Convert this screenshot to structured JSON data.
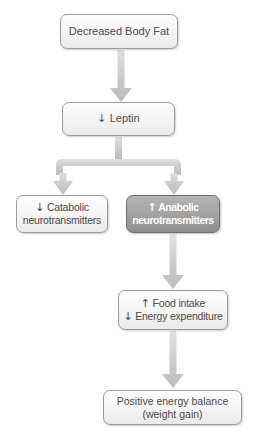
{
  "diagram": {
    "background_color": "#ffffff",
    "arrow_color": "#c9c9c9",
    "box_border_color": "#9b9b9b",
    "box_text_color": "#4a4a4a",
    "highlight_fill_color": "#a5a5a5",
    "highlight_text_color": "#ffffff"
  },
  "nodes": {
    "decreased_body_fat": {
      "label": "Decreased Body Fat"
    },
    "leptin": {
      "arrow": "↓",
      "label": "Leptin"
    },
    "catabolic": {
      "arrow": "↓",
      "line1": "Catabolic",
      "line2": "neurotransmitters"
    },
    "anabolic": {
      "arrow": "↑",
      "line1": "Anabolic",
      "line2": "neurotransmitters"
    },
    "food_intake": {
      "arrow_up": "↑",
      "line1": "Food intake",
      "arrow_down": "↓",
      "line2": "Energy expenditure"
    },
    "positive_energy": {
      "line1": "Positive energy balance",
      "line2": "(weight gain)"
    }
  },
  "connectors": [
    {
      "name": "body-fat-to-leptin",
      "type": "straight-arrow-down"
    },
    {
      "name": "leptin-split-to-catabolic-and-anabolic",
      "type": "split-arrow-down"
    },
    {
      "name": "anabolic-to-food-intake",
      "type": "straight-arrow-down"
    },
    {
      "name": "food-intake-to-positive-energy",
      "type": "straight-arrow-down"
    }
  ]
}
